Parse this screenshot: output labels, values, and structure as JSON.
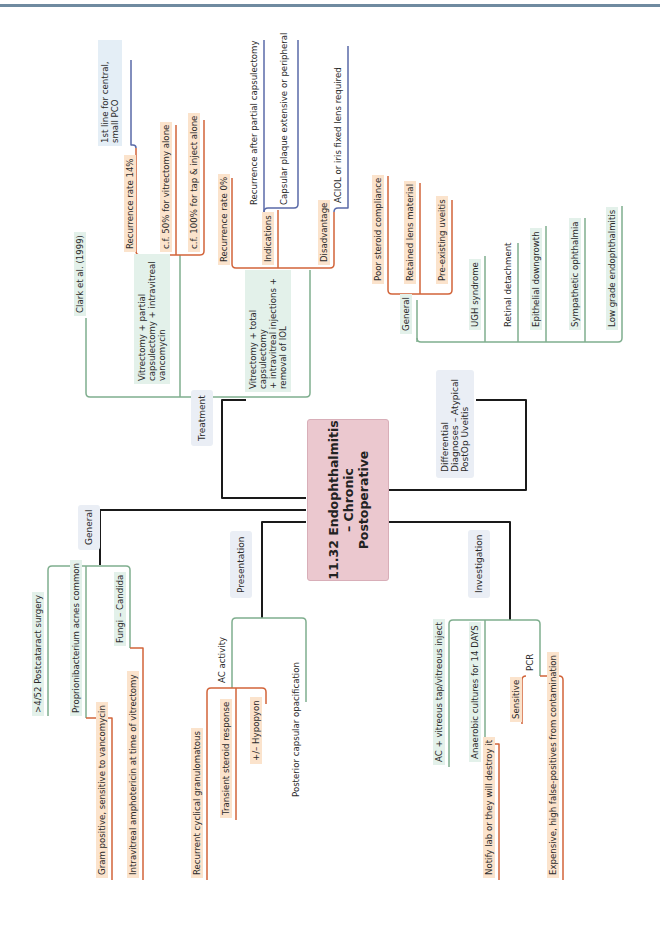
{
  "title": "11.32 Endophthalmitis – Chronic Postoperative",
  "colors": {
    "center_bg": "#ebc8cf",
    "green_line": "#7fae8e",
    "orange_line": "#d2643a",
    "blue_line": "#5a6aa8",
    "black_line": "#1a1a1a",
    "green_bg": "#e3f1ea",
    "orange_bg": "#fbe3cc"
  },
  "branches": {
    "treatment": {
      "label": "Treatment",
      "clark": "Clark et al. (1999)",
      "partial": {
        "label": "Vitrectomy + partial capsulectomy + intravitreal vancomycin",
        "lines": [
          "Vitrectomy + partial",
          "capsulectomy + intravitreal",
          "vancomycin"
        ],
        "recurrence": "Recurrence rate 14%",
        "first_line": [
          "1st line for central,",
          "small PCO"
        ],
        "cf1": "c.f. 50% for vitrectomy alone",
        "cf2": "c.f. 100% for tap & inject alone"
      },
      "total": {
        "lines": [
          "Vitrectomy + total",
          "capsulectomy",
          "+ intravitreal injections +",
          "removal of IOL"
        ],
        "recurrence": "Recurrence rate 0%",
        "indications": "Indications",
        "ind1": "Recurrence after partial capsulectomy",
        "ind2": "Capsular plaque extensive or peripheral",
        "disadvantage": "Disadvantage",
        "dis1": "ACIOL or iris fixed lens required"
      }
    },
    "differential": {
      "label_lines": [
        "Differential",
        "Diagnoses – Atypical",
        "PostOp Uveitis"
      ],
      "general": "General",
      "general_items": [
        "Poor steroid compliance",
        "Retained lens material",
        "Pre-existing uveitis"
      ],
      "items": [
        "UGH syndrome",
        "Retinal detachment",
        "Epithelial downgrowth",
        "Sympathetic ophthalmia",
        "Low grade endophthalmitis"
      ]
    },
    "general": {
      "label": "General",
      "items": [
        ">4/52 Postcataract surgery",
        "Proprionibacterium acnes common",
        "Fungi – Candida"
      ],
      "pacnes_sub": "Gram positive, sensitive to vancomycin",
      "fungi_sub": "Intravitreal amphotericin at time of vitrectomy"
    },
    "presentation": {
      "label": "Presentation",
      "ac": "AC activity",
      "ac_items": [
        "Recurrent cyclical granulomatous",
        "Transient steroid response",
        "+/– Hypopyon"
      ],
      "pco": "Posterior capsular opacification"
    },
    "investigation": {
      "label": "Investigation",
      "items": [
        "AC + vitreous tap/vitreous inject",
        "Anaerobic cultures for 14 DAYS",
        "PCR"
      ],
      "cultures_sub": "Notify lab or they will destroy it",
      "pcr_items": [
        "Sensitive",
        "Expensive, high false-positives from contamination"
      ]
    }
  }
}
